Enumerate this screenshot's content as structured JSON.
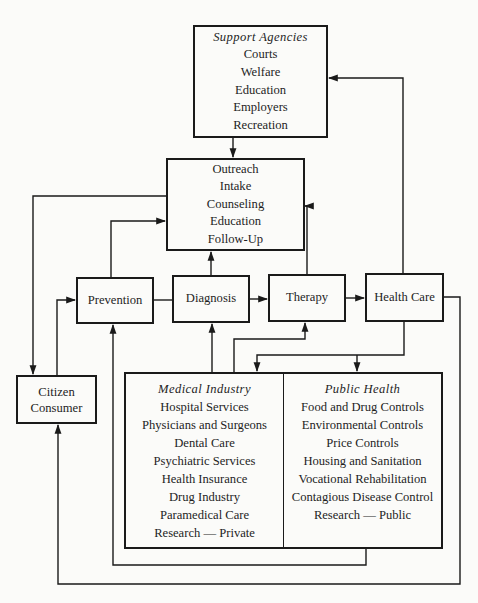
{
  "diagram": {
    "support_agencies": {
      "title": "Support Agencies",
      "items": [
        "Courts",
        "Welfare",
        "Education",
        "Employers",
        "Recreation"
      ]
    },
    "services": {
      "items": [
        "Outreach",
        "Intake",
        "Counseling",
        "Education",
        "Follow-Up"
      ]
    },
    "flow": {
      "prevention": "Prevention",
      "diagnosis": "Diagnosis",
      "therapy": "Therapy",
      "health_care": "Health Care"
    },
    "citizen_consumer": {
      "lines": [
        "Citizen",
        "Consumer"
      ]
    },
    "medical_industry": {
      "title": "Medical Industry",
      "items": [
        "Hospital Services",
        "Physicians and Surgeons",
        "Dental Care",
        "Psychiatric Services",
        "Health Insurance",
        "Drug Industry",
        "Paramedical Care",
        "Research — Private"
      ]
    },
    "public_health": {
      "title": "Public Health",
      "items": [
        "Food and Drug Controls",
        "Environmental Controls",
        "Price Controls",
        "Housing and Sanitation",
        "Vocational Rehabilitation",
        "Contagious Disease Control",
        "Research — Public"
      ]
    },
    "colors": {
      "line": "#1a1a1a",
      "background": "#fbfbf9"
    }
  }
}
